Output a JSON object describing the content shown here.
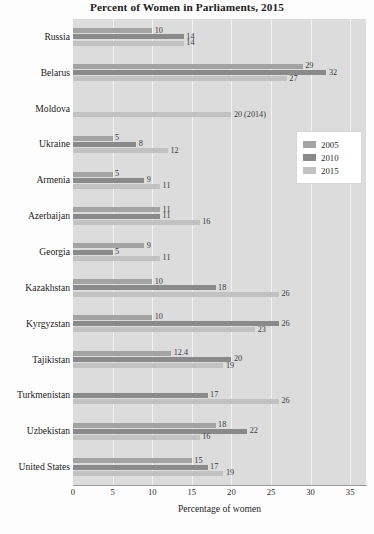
{
  "chart_data": {
    "type": "bar",
    "orientation": "horizontal",
    "title": "Percent of Women in Parliaments, 2015",
    "xlabel": "Percentage of women",
    "ylabel": "",
    "xlim": [
      0,
      37
    ],
    "xticks": [
      0,
      5,
      10,
      15,
      20,
      25,
      30,
      35
    ],
    "grid": true,
    "legend_position": "right",
    "categories": [
      "Russia",
      "Belarus",
      "Moldova",
      "Ukraine",
      "Armenia",
      "Azerbaijan",
      "Georgia",
      "Kazakhstan",
      "Kyrgyzstan",
      "Tajikistan",
      "Turkmenistan",
      "Uzbekistan",
      "United States"
    ],
    "series": [
      {
        "name": "2005",
        "color": "#a3a3a3",
        "values": [
          10,
          29,
          null,
          5,
          5,
          11,
          9,
          10,
          10,
          12.4,
          null,
          18,
          15
        ],
        "labels": [
          "10",
          "29",
          "",
          "5",
          "5",
          "11",
          "9",
          "10",
          "10",
          "12.4",
          "",
          "18",
          "15"
        ]
      },
      {
        "name": "2010",
        "color": "#8a8a8a",
        "values": [
          14,
          32,
          null,
          8,
          9,
          11,
          5,
          18,
          26,
          20,
          17,
          22,
          17
        ],
        "labels": [
          "14",
          "32",
          "",
          "8",
          "9",
          "11",
          "5",
          "18",
          "26",
          "20",
          "17",
          "22",
          "17"
        ]
      },
      {
        "name": "2015",
        "color": "#c2c2c2",
        "values": [
          14,
          27,
          20,
          12,
          11,
          16,
          11,
          26,
          23,
          19,
          26,
          16,
          19
        ],
        "labels": [
          "14",
          "27",
          "20 (2014)",
          "12",
          "11",
          "16",
          "11",
          "26",
          "23",
          "19",
          "26",
          "16",
          "19"
        ]
      }
    ]
  },
  "legend": {
    "items": [
      {
        "label": "2005"
      },
      {
        "label": "2010"
      },
      {
        "label": "2015"
      }
    ]
  }
}
